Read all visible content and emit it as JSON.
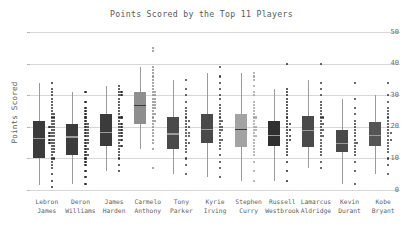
{
  "chart_data": {
    "type": "box",
    "title": "Points Scored by the Top 11 Players",
    "xlabel": "",
    "ylabel": "Points Scored",
    "ylim": [
      0,
      52
    ],
    "yticks": [
      0,
      10,
      20,
      30,
      40,
      50
    ],
    "ytick_labels": [
      "0",
      "10",
      "20",
      "30",
      "40",
      "50"
    ],
    "grid": true,
    "legend": "none",
    "overlay": "strip-plot of individual game scores to the right of each box",
    "categories": [
      "Lebron James",
      "Deron Williams",
      "James Harden",
      "Carmelo Anthony",
      "Tony Parker",
      "Kyrie Irving",
      "Stephen Curry",
      "Russell Westbrook",
      "Lamarcus Aldridge",
      "Kevin Durant",
      "Kobe Bryant"
    ],
    "category_lines": [
      [
        "Lebron",
        "James"
      ],
      [
        "Deron",
        "Williams"
      ],
      [
        "James",
        "Harden"
      ],
      [
        "Carmelo",
        "Anthony"
      ],
      [
        "Tony",
        "Parker"
      ],
      [
        "Kyrie",
        "Irving"
      ],
      [
        "Stephen",
        "Curry"
      ],
      [
        "Russell",
        "Westbrook"
      ],
      [
        "Lamarcus",
        "Aldridge"
      ],
      [
        "Kevin",
        "Durant"
      ],
      [
        "Kobe",
        "Bryant"
      ]
    ],
    "boxes": [
      {
        "name": "Lebron James",
        "q1": 10.0,
        "median": 16.5,
        "q3": 22.0,
        "whisker_low": 1.5,
        "whisker_high": 34.0,
        "box_color": "#3b3b3b",
        "point_color": "#303030"
      },
      {
        "name": "Deron Williams",
        "q1": 11.0,
        "median": 17.0,
        "q3": 21.0,
        "whisker_low": 2.0,
        "whisker_high": 31.0,
        "box_color": "#3b3b3b",
        "point_color": "#303030"
      },
      {
        "name": "James Harden",
        "q1": 14.0,
        "median": 18.5,
        "q3": 24.0,
        "whisker_low": 6.0,
        "whisker_high": 33.0,
        "box_color": "#3b3b3b",
        "point_color": "#303030"
      },
      {
        "name": "Carmelo Anthony",
        "q1": 21.0,
        "median": 27.0,
        "q3": 31.0,
        "whisker_low": 13.0,
        "whisker_high": 39.0,
        "box_color": "#8e8e8e",
        "point_color": "#8a8a8a"
      },
      {
        "name": "Tony Parker",
        "q1": 13.0,
        "median": 18.0,
        "q3": 23.0,
        "whisker_low": 5.0,
        "whisker_high": 35.0,
        "box_color": "#4a4a4a",
        "point_color": "#3a3a3a"
      },
      {
        "name": "Kyrie Irving",
        "q1": 15.0,
        "median": 19.5,
        "q3": 24.0,
        "whisker_low": 4.0,
        "whisker_high": 37.0,
        "box_color": "#4a4a4a",
        "point_color": "#3a3a3a"
      },
      {
        "name": "Stephen Curry",
        "q1": 13.5,
        "median": 19.5,
        "q3": 24.0,
        "whisker_low": 3.0,
        "whisker_high": 37.0,
        "box_color": "#a3a3a3",
        "point_color": "#a0a0a0"
      },
      {
        "name": "Russell Westbrook",
        "q1": 14.0,
        "median": 17.5,
        "q3": 22.0,
        "whisker_low": 3.0,
        "whisker_high": 32.0,
        "box_color": "#303030",
        "point_color": "#282828"
      },
      {
        "name": "Lamarcus Aldridge",
        "q1": 13.5,
        "median": 19.0,
        "q3": 23.5,
        "whisker_low": 7.0,
        "whisker_high": 35.0,
        "box_color": "#4a4a4a",
        "point_color": "#3a3a3a"
      },
      {
        "name": "Kevin Durant",
        "q1": 12.0,
        "median": 15.0,
        "q3": 19.0,
        "whisker_low": 2.0,
        "whisker_high": 29.0,
        "box_color": "#4a4a4a",
        "point_color": "#3a3a3a"
      },
      {
        "name": "Kobe Bryant",
        "q1": 14.0,
        "median": 17.5,
        "q3": 21.5,
        "whisker_low": 5.0,
        "whisker_high": 30.0,
        "box_color": "#555555",
        "point_color": "#3a3a3a"
      }
    ],
    "strip_points": [
      [
        1,
        3,
        5,
        7,
        8,
        9,
        10,
        10,
        11,
        12,
        12,
        13,
        13,
        14,
        14,
        15,
        15,
        15,
        16,
        16,
        16,
        17,
        17,
        17,
        18,
        18,
        18,
        19,
        19,
        20,
        20,
        20,
        21,
        21,
        22,
        22,
        23,
        23,
        24,
        24,
        25,
        26,
        27,
        28,
        29,
        30,
        31,
        32,
        34
      ],
      [
        2,
        4,
        6,
        8,
        9,
        10,
        11,
        11,
        12,
        13,
        13,
        14,
        15,
        15,
        16,
        16,
        17,
        17,
        18,
        18,
        19,
        19,
        20,
        20,
        21,
        21,
        22,
        23,
        24,
        25,
        26,
        28,
        31
      ],
      [
        6,
        8,
        10,
        11,
        12,
        13,
        14,
        14,
        15,
        16,
        16,
        17,
        17,
        18,
        18,
        19,
        19,
        20,
        20,
        21,
        21,
        22,
        23,
        23,
        24,
        25,
        26,
        27,
        28,
        29,
        30,
        30,
        31,
        31,
        32,
        33
      ],
      [
        7,
        13,
        15,
        16,
        17,
        18,
        19,
        20,
        21,
        22,
        22,
        23,
        24,
        24,
        25,
        26,
        26,
        27,
        27,
        28,
        28,
        29,
        29,
        30,
        30,
        31,
        31,
        32,
        33,
        34,
        35,
        36,
        37,
        38,
        39,
        44,
        45
      ],
      [
        5,
        8,
        10,
        12,
        13,
        14,
        15,
        15,
        16,
        17,
        17,
        18,
        18,
        19,
        20,
        20,
        21,
        22,
        22,
        23,
        24,
        25,
        26,
        28,
        30,
        32,
        35
      ],
      [
        4,
        7,
        9,
        11,
        13,
        14,
        15,
        16,
        16,
        17,
        18,
        19,
        19,
        20,
        20,
        21,
        22,
        22,
        23,
        24,
        25,
        26,
        27,
        29,
        30,
        32,
        34,
        36,
        39
      ],
      [
        3,
        6,
        9,
        11,
        12,
        13,
        14,
        15,
        16,
        17,
        17,
        18,
        19,
        19,
        20,
        20,
        21,
        22,
        23,
        23,
        24,
        25,
        26,
        27,
        28,
        30,
        31,
        33,
        35,
        36,
        37
      ],
      [
        3,
        6,
        9,
        11,
        12,
        13,
        14,
        15,
        16,
        16,
        17,
        17,
        18,
        19,
        19,
        20,
        21,
        21,
        22,
        23,
        24,
        25,
        26,
        27,
        28,
        29,
        30,
        31,
        32,
        40
      ],
      [
        7,
        9,
        11,
        12,
        13,
        14,
        15,
        16,
        17,
        17,
        18,
        19,
        19,
        20,
        21,
        21,
        22,
        23,
        23,
        24,
        25,
        26,
        27,
        28,
        30,
        32,
        34,
        40
      ],
      [
        2,
        6,
        9,
        11,
        12,
        13,
        14,
        15,
        15,
        16,
        17,
        18,
        19,
        20,
        21,
        22,
        24,
        26,
        29,
        34
      ],
      [
        5,
        8,
        10,
        12,
        13,
        14,
        15,
        16,
        16,
        17,
        18,
        18,
        19,
        20,
        21,
        22,
        23,
        24,
        25,
        26,
        28,
        30,
        34
      ]
    ]
  }
}
